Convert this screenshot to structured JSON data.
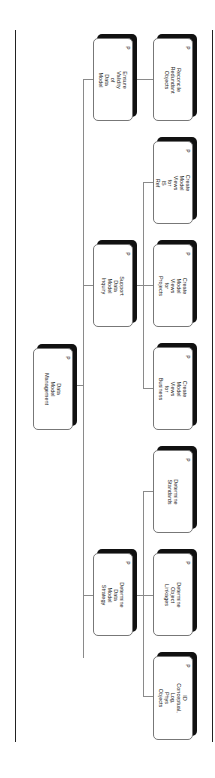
{
  "diagram": {
    "type": "hierarchy",
    "orientation": "rotated-90",
    "colors": {
      "box_fill": "#ffffff",
      "shadow": "#111111",
      "connector": "#8a8a8a",
      "frame": "#222222"
    },
    "root": {
      "label": "Data\nModel\nManagement",
      "marker": "P"
    },
    "branches": [
      {
        "label": "Ensure\nValidity\nof\nData\nModel",
        "marker": "P",
        "children": [
          {
            "label": "Reconcile\nRedundant\nObjects",
            "marker": "P"
          }
        ]
      },
      {
        "label": "Support\nData\nModel\nInquiry",
        "marker": "P",
        "children": [
          {
            "label": "Create\nModel\nViews\nfor\nIS\nRef",
            "marker": "P"
          },
          {
            "label": "Create\nModel\nViews\nfor\nProjects",
            "marker": "P"
          },
          {
            "label": "Create\nModel\nViews\nfor\nBusiness",
            "marker": "P"
          }
        ]
      },
      {
        "label": "Determine\nData\nModel\nStrategy",
        "marker": "P",
        "children": [
          {
            "label": "Determine\nStandards",
            "marker": "P"
          },
          {
            "label": "Determine\nObject\nLinkages",
            "marker": "P"
          },
          {
            "label": "ID\nConceptual,\nLog,\nPhys\nObjects",
            "marker": "P"
          }
        ]
      }
    ]
  }
}
